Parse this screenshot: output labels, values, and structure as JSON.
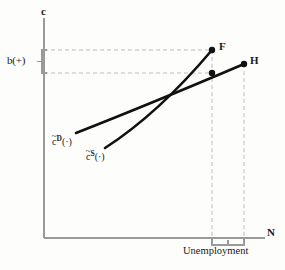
{
  "figure": {
    "type": "diagram",
    "background_color": "#fdfdfc",
    "axis_color": "#8a8a8a",
    "curve_color": "#111111",
    "dash_color": "#b4b4b4"
  },
  "axes": {
    "y_label": "c",
    "x_label": "N",
    "origin": {
      "x": 44,
      "y": 238
    },
    "y_top": {
      "x": 44,
      "y": 18
    },
    "x_right": {
      "x": 265,
      "y": 238
    }
  },
  "labels": {
    "b_bracket": "b(+)",
    "unemployment": "Unemployment",
    "point_f": "F",
    "point_h": "H"
  },
  "curves": [
    {
      "name": "demand-curve",
      "label_base": "c",
      "label_tilde": "~",
      "label_superscript": "D",
      "label_suffix": "(·)",
      "start": {
        "x": 76,
        "y": 133
      },
      "end": {
        "x": 244,
        "y": 64
      }
    },
    {
      "name": "supply-curve",
      "label_base": "c",
      "label_tilde": "~",
      "label_superscript": "S",
      "label_suffix": "(·)",
      "start": {
        "x": 105,
        "y": 148
      },
      "end": {
        "x": 212,
        "y": 50
      }
    }
  ],
  "points": [
    {
      "name": "point-f",
      "label": "F",
      "x": 212,
      "y": 50
    },
    {
      "name": "point-intersection",
      "label": "",
      "x": 212,
      "y": 73
    },
    {
      "name": "point-h",
      "label": "H",
      "x": 244,
      "y": 64
    }
  ],
  "guides": {
    "horizontal_upper": {
      "y": 50,
      "x_from": 44,
      "x_to": 212
    },
    "horizontal_lower": {
      "y": 73,
      "x_from": 44,
      "x_to": 212
    },
    "vertical_f": {
      "x": 212,
      "y_from": 50,
      "y_to": 244
    },
    "vertical_h": {
      "x": 244,
      "y_from": 64,
      "y_to": 244
    }
  },
  "brackets": {
    "b_bracket": {
      "x": 44,
      "y_top": 50,
      "y_bottom": 73,
      "depth": 5
    },
    "unemployment_bracket": {
      "x_left": 212,
      "x_right": 244,
      "y": 241,
      "depth": 5
    }
  }
}
